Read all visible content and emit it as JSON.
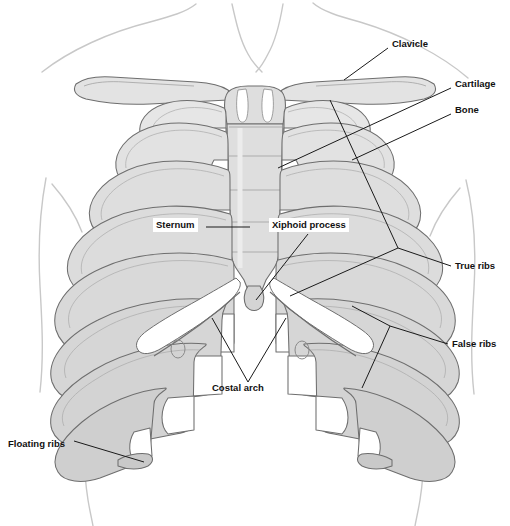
{
  "figure": {
    "view": "anterior",
    "width": 510,
    "height": 526,
    "background_color": "#ffffff"
  },
  "colors": {
    "bone_fill": "#d9d9d9",
    "bone_fill_light": "#ececec",
    "cartilage_fill": "#ffffff",
    "sternum_fill": "#dedede",
    "outline": "#6e6e6e",
    "body_contour": "#c8c8c8",
    "leader_line": "#1a1a1a",
    "label_text": "#111111"
  },
  "labels": [
    {
      "id": "clavicle",
      "text": "Clavicle",
      "x": 392,
      "y": 44,
      "align": "left",
      "boxed": false
    },
    {
      "id": "cartilage",
      "text": "Cartilage",
      "x": 455,
      "y": 84,
      "align": "left",
      "boxed": false
    },
    {
      "id": "bone",
      "text": "Bone",
      "x": 455,
      "y": 110,
      "align": "left",
      "boxed": false
    },
    {
      "id": "true-ribs",
      "text": "True ribs",
      "x": 455,
      "y": 267,
      "align": "left",
      "boxed": false
    },
    {
      "id": "false-ribs",
      "text": "False ribs",
      "x": 452,
      "y": 345,
      "align": "left",
      "boxed": false
    },
    {
      "id": "sternum",
      "text": "Sternum",
      "x": 156,
      "y": 223,
      "align": "left",
      "boxed": true
    },
    {
      "id": "xiphoid-process",
      "text": "Xiphoid process",
      "x": 272,
      "y": 223,
      "align": "left",
      "boxed": true
    },
    {
      "id": "costal-arch",
      "text": "Costal arch",
      "x": 212,
      "y": 388,
      "align": "left",
      "boxed": false
    },
    {
      "id": "floating-ribs",
      "text": "Floating ribs",
      "x": 8,
      "y": 444,
      "align": "left",
      "boxed": false
    }
  ],
  "structures": {
    "clavicle_left": "Left clavicle",
    "clavicle_right": "Right clavicle",
    "sternum_manubrium": "Manubrium of sternum",
    "sternum_body": "Body of sternum",
    "sternum_xiphoid": "Xiphoid process",
    "rib_pairs_total": 12,
    "true_rib_pairs": 7,
    "false_rib_pairs": 5,
    "floating_rib_pairs": 2,
    "costal_cartilage": "Costal cartilage",
    "costal_arch": "Costal arch",
    "body_outline": "Torso and shoulder contour"
  },
  "leaders": {
    "clavicle": "line from label to right clavicle shaft",
    "cartilage": "line from label to costal cartilage near sternum",
    "bone": "line from label to bony rib shaft",
    "true_ribs": "bracket from label to upper seven ribs",
    "false_ribs": "bracket from label to lower five ribs",
    "sternum": "horizontal line from label to sternum body",
    "xiphoid_process": "diagonal line from label to xiphoid tip",
    "costal_arch": "V bracket from label up to both costal margins",
    "floating_ribs": "line from label to free rib tip"
  }
}
